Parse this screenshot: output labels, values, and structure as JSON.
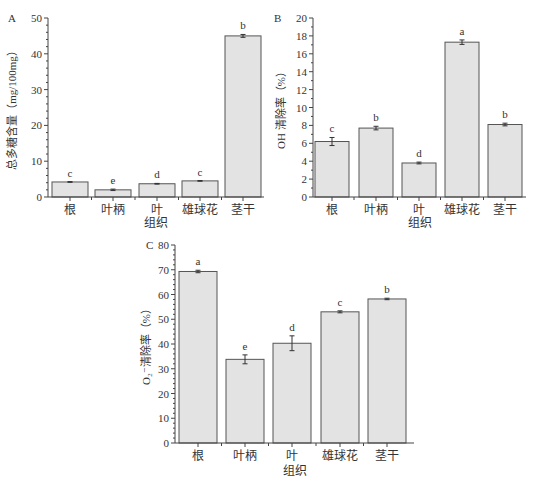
{
  "chart_data": [
    {
      "type": "bar",
      "panel": "A",
      "title": "",
      "xlabel": "组织",
      "ylabel": "总多糖含量（mg/100mg）",
      "categories": [
        "根",
        "叶柄",
        "叶",
        "雄球花",
        "茎干"
      ],
      "values": [
        4.2,
        2.0,
        3.7,
        4.5,
        45.0
      ],
      "errors": [
        0.1,
        0.2,
        0.1,
        0.1,
        0.4
      ],
      "significance": [
        "c",
        "e",
        "d",
        "c",
        "b"
      ],
      "ylim": [
        0,
        50
      ],
      "yticks": [
        0,
        10,
        20,
        30,
        40,
        50
      ],
      "grid": false
    },
    {
      "type": "bar",
      "panel": "B",
      "title": "",
      "xlabel": "组织",
      "ylabel": "OH 清除率（%）",
      "categories": [
        "根",
        "叶柄",
        "叶",
        "雄球花",
        "茎干"
      ],
      "values": [
        6.2,
        7.7,
        3.8,
        17.3,
        8.1
      ],
      "errors": [
        0.45,
        0.2,
        0.1,
        0.25,
        0.15
      ],
      "significance": [
        "c",
        "b",
        "d",
        "a",
        "b"
      ],
      "ylim": [
        0,
        20
      ],
      "yticks": [
        0,
        2,
        4,
        6,
        8,
        10,
        12,
        14,
        16,
        18,
        20
      ],
      "grid": false
    },
    {
      "type": "bar",
      "panel": "C",
      "title": "",
      "xlabel": "组织",
      "ylabel": "O₂⁻ 清除率（%）",
      "categories": [
        "根",
        "叶柄",
        "叶",
        "雄球花",
        "茎干"
      ],
      "values": [
        69.3,
        33.8,
        40.3,
        53.0,
        58.2
      ],
      "errors": [
        0.5,
        1.8,
        3.0,
        0.4,
        0.3
      ],
      "significance": [
        "a",
        "e",
        "d",
        "c",
        "b"
      ],
      "ylim": [
        0,
        80
      ],
      "yticks": [
        0,
        10,
        20,
        30,
        40,
        50,
        60,
        70,
        80
      ],
      "grid": false
    }
  ],
  "panels": {
    "A": {
      "label": "A",
      "ylabel": "总多糖含量（mg/100mg）",
      "xlabel": "组织"
    },
    "B": {
      "label": "B",
      "ylabel": "OH 清除率（%）",
      "xlabel": "组织"
    },
    "C": {
      "label": "C",
      "ylabel": "O₂⁻清除率（%）",
      "xlabel": "组织"
    }
  }
}
